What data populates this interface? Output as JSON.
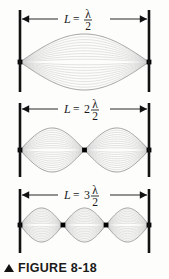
{
  "figure": {
    "caption_marker": "▲",
    "caption_text": "FIGURE 8-18",
    "background_color": "#fdfdfb",
    "wall_color": "#111111",
    "node_color": "#000000",
    "envelope_color": "#8d8d8d",
    "inner_wave_color": "#c9c9c9",
    "arrow_color": "#111111",
    "label_color": "#1a1a1a"
  },
  "panels": [
    {
      "id": "panel-1",
      "harmonic": 1,
      "loops": 1,
      "label": {
        "lhs": "L",
        "equals": "=",
        "coefficient": "",
        "numerator": "λ",
        "denominator": "2",
        "full_text": "L = λ/2"
      },
      "interior_nodes": 0,
      "node_positions_fraction": [
        0,
        1
      ],
      "antinode_positions_fraction": [
        0.5
      ]
    },
    {
      "id": "panel-2",
      "harmonic": 2,
      "loops": 2,
      "label": {
        "lhs": "L",
        "equals": "=",
        "coefficient": "2",
        "numerator": "λ",
        "denominator": "2",
        "full_text": "L = 2λ/2"
      },
      "interior_nodes": 1,
      "node_positions_fraction": [
        0,
        0.5,
        1
      ],
      "antinode_positions_fraction": [
        0.25,
        0.75
      ]
    },
    {
      "id": "panel-3",
      "harmonic": 3,
      "loops": 3,
      "label": {
        "lhs": "L",
        "equals": "=",
        "coefficient": "3",
        "numerator": "λ",
        "denominator": "2",
        "full_text": "L = 3λ/2"
      },
      "interior_nodes": 2,
      "node_positions_fraction": [
        0,
        0.333,
        0.667,
        1
      ],
      "antinode_positions_fraction": [
        0.167,
        0.5,
        0.833
      ]
    }
  ]
}
